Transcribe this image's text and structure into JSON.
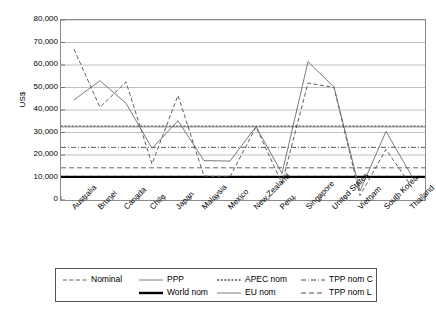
{
  "chart_data": {
    "type": "line",
    "title": "",
    "subtitle": "",
    "xlabel": "",
    "ylabel": "US$",
    "ylim": [
      0,
      80000
    ],
    "ytick_step": 10000,
    "ytick_labels": [
      "80,000",
      "70,000",
      "60,000",
      "50,000",
      "40,000",
      "30,000",
      "20,000",
      "10,000",
      "0"
    ],
    "ytick_values": [
      80000,
      70000,
      60000,
      50000,
      40000,
      30000,
      20000,
      10000,
      0
    ],
    "grid": true,
    "grid_axis": "y",
    "legend_position": "bottom",
    "categories": [
      "Australia",
      "Brunei",
      "Canada",
      "Chile",
      "Japan",
      "Malaysia",
      "Mexico",
      "New Zealand",
      "Peru",
      "Singapore",
      "United States",
      "Vietnam",
      "South Korea",
      "Thailand"
    ],
    "series": [
      {
        "name": "Nominal",
        "style": "dashed",
        "color": "#4d4d4d",
        "reference_line": false,
        "values": [
          67000,
          41200,
          52500,
          16000,
          46500,
          10600,
          10300,
          32500,
          7400,
          52000,
          50000,
          2000,
          22500,
          5700
        ]
      },
      {
        "name": "PPP",
        "style": "solid",
        "color": "#6b6b6b",
        "reference_line": false,
        "values": [
          44500,
          53000,
          43000,
          23000,
          35200,
          17500,
          17300,
          32600,
          11800,
          61500,
          50200,
          4000,
          30500,
          10500
        ]
      },
      {
        "name": "APEC nom",
        "style": "dotted",
        "color": "#555555",
        "reference_line": true,
        "value": 32800
      },
      {
        "name": "TPP nom C",
        "style": "dash-dot",
        "color": "#5a5a5a",
        "reference_line": true,
        "value": 23400
      },
      {
        "name": "World nom",
        "style": "thick-solid",
        "color": "#000000",
        "reference_line": true,
        "value": 10300
      },
      {
        "name": "EU nom",
        "style": "solid",
        "color": "#777777",
        "reference_line": true,
        "value": 32500
      },
      {
        "name": "TPP nom L",
        "style": "dashed-gray",
        "color": "#666666",
        "reference_line": true,
        "value": 14300
      }
    ]
  },
  "legend": {
    "rows": [
      [
        {
          "label": "Nominal",
          "style": "dashed"
        },
        {
          "label": "PPP",
          "style": "solid"
        },
        {
          "label": "APEC nom",
          "style": "dotted"
        },
        {
          "label": "TPP nom C",
          "style": "dash-dot"
        }
      ],
      [
        {
          "label": "World nom",
          "style": "thick-solid"
        },
        {
          "label": "EU nom",
          "style": "solid"
        },
        {
          "label": "TPP nom L",
          "style": "dashed-gray"
        }
      ]
    ]
  },
  "axis": {
    "y_title": "US$"
  },
  "colors": {
    "frame": "#8a8a8a",
    "grid": "#b0b0b0",
    "nominal": "#4d4d4d",
    "ppp": "#6b6b6b",
    "world": "#000000"
  }
}
